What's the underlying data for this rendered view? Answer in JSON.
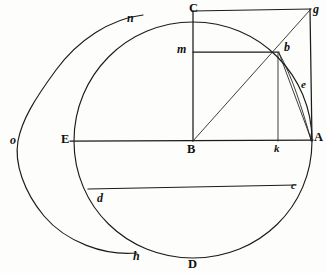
{
  "figure": {
    "background_color": "#fdfdfb",
    "ink_color": "#1b1b1b",
    "width": 326,
    "height": 273
  },
  "labels": {
    "C": "C",
    "g": "g",
    "n": "n",
    "m": "m",
    "b": "b",
    "e": "e",
    "o": "o",
    "E": "E",
    "B": "B",
    "k": "k",
    "A": "A",
    "d": "d",
    "c": "c",
    "h": "h",
    "D": "D"
  },
  "points": [
    {
      "name": "C",
      "x": 193,
      "y": 22,
      "label": "C",
      "style": "upper"
    },
    {
      "name": "g",
      "x": 310,
      "y": 10,
      "label": "g",
      "style": "lower"
    },
    {
      "name": "n",
      "x": 143,
      "y": 15,
      "label": "n",
      "style": "lower"
    },
    {
      "name": "m",
      "x": 193,
      "y": 52,
      "label": "m",
      "style": "lower"
    },
    {
      "name": "b",
      "x": 278,
      "y": 52,
      "label": "b",
      "style": "lower"
    },
    {
      "name": "e",
      "x": 303,
      "y": 88,
      "label": "e",
      "style": "lower"
    },
    {
      "name": "o",
      "x": 10,
      "y": 141,
      "label": "o",
      "style": "lower"
    },
    {
      "name": "E",
      "x": 74,
      "y": 141,
      "label": "E",
      "style": "upper"
    },
    {
      "name": "B",
      "x": 193,
      "y": 141,
      "label": "B",
      "style": "upper"
    },
    {
      "name": "k",
      "x": 278,
      "y": 141,
      "label": "k",
      "style": "lower"
    },
    {
      "name": "A",
      "x": 312,
      "y": 141,
      "label": "A",
      "style": "upper"
    },
    {
      "name": "d",
      "x": 92,
      "y": 190,
      "label": "d",
      "style": "lower"
    },
    {
      "name": "c",
      "x": 292,
      "y": 186,
      "label": "c",
      "style": "lower"
    },
    {
      "name": "h",
      "x": 137,
      "y": 253,
      "label": "h",
      "style": "lower"
    },
    {
      "name": "D",
      "x": 193,
      "y": 258,
      "label": "D",
      "style": "upper"
    }
  ],
  "geometry": {
    "inner_circle": {
      "center_x": 193,
      "center_y": 141,
      "radius": 119,
      "label": "circle-CADE"
    },
    "outer_circle": {
      "center_x": 67,
      "center_y": 141,
      "radius": 134,
      "label": "circle-o"
    },
    "square": {
      "left": 193,
      "top": 10,
      "right": 310,
      "bottom": 141,
      "label": "square-BCgA"
    },
    "diagonal": {
      "x1": 193,
      "y1": 141,
      "x2": 310,
      "y2": 10,
      "label": "diagonal-Bg"
    },
    "line_mb": {
      "x1": 193,
      "y1": 52,
      "x2": 278,
      "y2": 52
    },
    "line_bk": {
      "x1": 278,
      "y1": 52,
      "x2": 278,
      "y2": 141
    },
    "line_ba": {
      "x1": 278,
      "y1": 52,
      "x2": 311,
      "y2": 140
    },
    "line_EA": {
      "x1": 70,
      "y1": 141,
      "x2": 313,
      "y2": 140
    },
    "chord_dc": {
      "x1": 88,
      "y1": 189,
      "x2": 296,
      "y2": 185
    },
    "arc_CA": {
      "from": "C",
      "to": "A",
      "center": "B",
      "radius": 119
    },
    "arc_bA": {
      "from": "b",
      "to": "A",
      "bulge": "right"
    }
  },
  "text_labels_note": "Upper-case roman labels: C, E, B, A, D. Lower-case italic labels: g, n, m, b, e, o, k, d, c, h."
}
